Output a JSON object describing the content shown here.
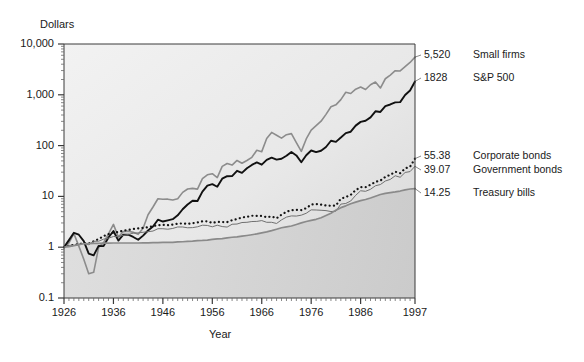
{
  "figure": {
    "y_axis_title": "Dollars",
    "x_axis_title": "Year"
  },
  "chart_data": {
    "type": "line",
    "title": "",
    "subtitle": "",
    "xlabel": "Year",
    "ylabel": "Dollars",
    "yscale": "log",
    "ylim": [
      0.1,
      10000
    ],
    "xlim": [
      1926,
      1997
    ],
    "grid": false,
    "legend_position": "right-of-plot-endpoints",
    "ytick_labels": [
      "10,000",
      "1,000",
      "100",
      "10",
      "1",
      "0.1"
    ],
    "ytick_values": [
      10000,
      1000,
      100,
      10,
      1,
      0.1
    ],
    "xtick_labels": [
      "1926",
      "1936",
      "1946",
      "1956",
      "1966",
      "1976",
      "1986",
      "1997"
    ],
    "xtick_values": [
      1926,
      1936,
      1946,
      1956,
      1966,
      1976,
      1986,
      1997
    ],
    "end_values": {
      "small_firms": "5,520",
      "sp500": "1828",
      "corporate_bonds": "55.38",
      "government_bonds": "39.07",
      "treasury_bills": "14.25"
    },
    "series": [
      {
        "name": "Small firms",
        "label": "Small firms",
        "end_value_label": "5,520",
        "end_value": 5520,
        "color": "#8c8c8c",
        "style": "solid",
        "width": 1.6,
        "x": [
          1926,
          1927,
          1928,
          1929,
          1930,
          1931,
          1932,
          1933,
          1934,
          1935,
          1936,
          1937,
          1938,
          1939,
          1940,
          1941,
          1942,
          1943,
          1944,
          1945,
          1946,
          1947,
          1948,
          1949,
          1950,
          1951,
          1952,
          1953,
          1954,
          1955,
          1956,
          1957,
          1958,
          1959,
          1960,
          1961,
          1962,
          1963,
          1964,
          1965,
          1966,
          1967,
          1968,
          1969,
          1970,
          1971,
          1972,
          1973,
          1974,
          1975,
          1976,
          1977,
          1978,
          1979,
          1980,
          1981,
          1982,
          1983,
          1984,
          1985,
          1986,
          1987,
          1988,
          1989,
          1990,
          1991,
          1992,
          1993,
          1994,
          1995,
          1996,
          1997
        ],
        "y": [
          1.0,
          1.22,
          1.85,
          1.05,
          0.58,
          0.3,
          0.32,
          0.99,
          1.23,
          1.82,
          2.81,
          1.58,
          2.03,
          2.07,
          1.96,
          1.79,
          2.37,
          4.35,
          6.19,
          9.0,
          8.76,
          8.82,
          8.48,
          8.98,
          12.0,
          14.0,
          14.4,
          13.9,
          22.3,
          26.6,
          28.0,
          23.5,
          38.9,
          44.4,
          41.4,
          51.0,
          45.0,
          51.0,
          58.8,
          81.0,
          76.0,
          138.0,
          182.0,
          160.0,
          140.0,
          164.0,
          172.0,
          114.0,
          77.0,
          135.0,
          202.0,
          247.0,
          302.0,
          412.0,
          581.0,
          634.0,
          803.0,
          1120.0,
          1060.0,
          1290.0,
          1420.0,
          1270.0,
          1580.0,
          1780.0,
          1360.0,
          2070.0,
          2450.0,
          2980.0,
          2950.0,
          3580.0,
          4330.0,
          5520.0
        ]
      },
      {
        "name": "S&P 500",
        "label": "S&P 500",
        "end_value_label": "1828",
        "end_value": 1828,
        "color": "#111111",
        "style": "solid",
        "width": 1.9,
        "x": [
          1926,
          1927,
          1928,
          1929,
          1930,
          1931,
          1932,
          1933,
          1934,
          1935,
          1936,
          1937,
          1938,
          1939,
          1940,
          1941,
          1942,
          1943,
          1944,
          1945,
          1946,
          1947,
          1948,
          1949,
          1950,
          1951,
          1952,
          1953,
          1954,
          1955,
          1956,
          1957,
          1958,
          1959,
          1960,
          1961,
          1962,
          1963,
          1964,
          1965,
          1966,
          1967,
          1968,
          1969,
          1970,
          1971,
          1972,
          1973,
          1974,
          1975,
          1976,
          1977,
          1978,
          1979,
          1980,
          1981,
          1982,
          1983,
          1984,
          1985,
          1986,
          1987,
          1988,
          1989,
          1990,
          1991,
          1992,
          1993,
          1994,
          1995,
          1996,
          1997
        ],
        "y": [
          1.0,
          1.38,
          1.92,
          1.76,
          1.32,
          0.75,
          0.69,
          1.06,
          1.05,
          1.55,
          2.08,
          1.35,
          1.77,
          1.76,
          1.59,
          1.4,
          1.69,
          2.13,
          2.55,
          3.48,
          3.2,
          3.38,
          3.56,
          4.24,
          5.58,
          6.92,
          8.19,
          8.11,
          12.4,
          16.3,
          17.4,
          15.5,
          22.3,
          25.0,
          25.1,
          31.9,
          29.1,
          35.7,
          41.6,
          46.8,
          42.1,
          52.2,
          58.0,
          53.1,
          55.2,
          63.1,
          75.1,
          64.1,
          47.1,
          64.7,
          80.1,
          74.4,
          79.3,
          94.0,
          124.5,
          118.4,
          143.9,
          176.4,
          187.6,
          247.2,
          293.2,
          308.6,
          359.8,
          473.7,
          459.0,
          598.9,
          644.5,
          709.3,
          718.7,
          988.8,
          1215.0,
          1828.0
        ]
      },
      {
        "name": "Corporate bonds",
        "label": "Corporate bonds",
        "end_value_label": "55.38",
        "end_value": 55.38,
        "color": "#141414",
        "style": "dotted",
        "width": 2.2,
        "x": [
          1926,
          1927,
          1928,
          1929,
          1930,
          1931,
          1932,
          1933,
          1934,
          1935,
          1936,
          1937,
          1938,
          1939,
          1940,
          1941,
          1942,
          1943,
          1944,
          1945,
          1946,
          1947,
          1948,
          1949,
          1950,
          1951,
          1952,
          1953,
          1954,
          1955,
          1956,
          1957,
          1958,
          1959,
          1960,
          1961,
          1962,
          1963,
          1964,
          1965,
          1966,
          1967,
          1968,
          1969,
          1970,
          1971,
          1972,
          1973,
          1974,
          1975,
          1976,
          1977,
          1978,
          1979,
          1980,
          1981,
          1982,
          1983,
          1984,
          1985,
          1986,
          1987,
          1988,
          1989,
          1990,
          1991,
          1992,
          1993,
          1994,
          1995,
          1996,
          1997
        ],
        "y": [
          1.0,
          1.07,
          1.11,
          1.15,
          1.2,
          1.18,
          1.31,
          1.45,
          1.65,
          1.81,
          1.94,
          2.0,
          2.12,
          2.2,
          2.28,
          2.35,
          2.41,
          2.48,
          2.6,
          2.71,
          2.75,
          2.71,
          2.8,
          2.89,
          2.95,
          2.87,
          2.97,
          3.07,
          3.23,
          3.23,
          3.01,
          3.15,
          3.13,
          3.12,
          3.4,
          3.57,
          3.85,
          3.96,
          4.16,
          4.13,
          4.13,
          3.9,
          4.03,
          3.71,
          4.38,
          5.0,
          5.34,
          5.43,
          5.38,
          5.87,
          6.91,
          7.04,
          6.91,
          6.64,
          6.52,
          6.61,
          9.0,
          9.72,
          10.7,
          13.3,
          15.2,
          15.2,
          17.0,
          19.4,
          20.5,
          24.2,
          26.6,
          30.6,
          28.6,
          35.5,
          38.4,
          55.38
        ]
      },
      {
        "name": "Government bonds",
        "label": "Government bonds",
        "end_value_label": "39.07",
        "end_value": 39.07,
        "color": "#707070",
        "style": "solid",
        "width": 1.0,
        "x": [
          1926,
          1927,
          1928,
          1929,
          1930,
          1931,
          1932,
          1933,
          1934,
          1935,
          1936,
          1937,
          1938,
          1939,
          1940,
          1941,
          1942,
          1943,
          1944,
          1945,
          1946,
          1947,
          1948,
          1949,
          1950,
          1951,
          1952,
          1953,
          1954,
          1955,
          1956,
          1957,
          1958,
          1959,
          1960,
          1961,
          1962,
          1963,
          1964,
          1965,
          1966,
          1967,
          1968,
          1969,
          1970,
          1971,
          1972,
          1973,
          1974,
          1975,
          1976,
          1977,
          1978,
          1979,
          1980,
          1981,
          1982,
          1983,
          1984,
          1985,
          1986,
          1987,
          1988,
          1989,
          1990,
          1991,
          1992,
          1993,
          1994,
          1995,
          1996,
          1997
        ],
        "y": [
          1.0,
          1.09,
          1.09,
          1.13,
          1.18,
          1.12,
          1.31,
          1.31,
          1.44,
          1.51,
          1.62,
          1.62,
          1.71,
          1.78,
          1.89,
          1.91,
          1.97,
          2.02,
          2.08,
          2.31,
          2.31,
          2.26,
          2.34,
          2.5,
          2.5,
          2.41,
          2.43,
          2.52,
          2.71,
          2.68,
          2.52,
          2.71,
          2.55,
          2.49,
          2.83,
          2.86,
          3.06,
          3.09,
          3.2,
          3.22,
          3.34,
          3.09,
          3.09,
          2.93,
          3.45,
          3.91,
          4.13,
          4.1,
          4.27,
          4.66,
          5.43,
          5.4,
          5.33,
          5.25,
          5.03,
          5.12,
          7.05,
          7.26,
          8.12,
          10.5,
          12.9,
          12.6,
          13.8,
          16.2,
          17.1,
          20.1,
          21.6,
          25.5,
          23.8,
          29.6,
          30.8,
          39.07
        ]
      },
      {
        "name": "Treasury bills",
        "label": "Treasury bills",
        "end_value_label": "14.25",
        "end_value": 14.25,
        "color": "#8a8a8a",
        "style": "solid",
        "width": 1.7,
        "x": [
          1926,
          1927,
          1928,
          1929,
          1930,
          1931,
          1932,
          1933,
          1934,
          1935,
          1936,
          1937,
          1938,
          1939,
          1940,
          1941,
          1942,
          1943,
          1944,
          1945,
          1946,
          1947,
          1948,
          1949,
          1950,
          1951,
          1952,
          1953,
          1954,
          1955,
          1956,
          1957,
          1958,
          1959,
          1960,
          1961,
          1962,
          1963,
          1964,
          1965,
          1966,
          1967,
          1968,
          1969,
          1970,
          1971,
          1972,
          1973,
          1974,
          1975,
          1976,
          1977,
          1978,
          1979,
          1980,
          1981,
          1982,
          1983,
          1984,
          1985,
          1986,
          1987,
          1988,
          1989,
          1990,
          1991,
          1992,
          1993,
          1994,
          1995,
          1996,
          1997
        ],
        "y": [
          1.0,
          1.03,
          1.07,
          1.12,
          1.17,
          1.18,
          1.19,
          1.19,
          1.2,
          1.2,
          1.21,
          1.21,
          1.21,
          1.21,
          1.21,
          1.21,
          1.22,
          1.22,
          1.23,
          1.23,
          1.24,
          1.24,
          1.25,
          1.27,
          1.28,
          1.3,
          1.32,
          1.35,
          1.36,
          1.38,
          1.42,
          1.46,
          1.48,
          1.53,
          1.57,
          1.6,
          1.65,
          1.7,
          1.76,
          1.83,
          1.92,
          2.01,
          2.12,
          2.26,
          2.41,
          2.52,
          2.61,
          2.8,
          3.02,
          3.21,
          3.37,
          3.54,
          3.8,
          4.2,
          4.67,
          5.37,
          6.0,
          6.52,
          7.16,
          7.72,
          8.24,
          8.7,
          9.31,
          10.1,
          10.9,
          11.5,
          11.9,
          12.25,
          12.75,
          13.45,
          14.0,
          14.25
        ]
      }
    ]
  },
  "plot": {
    "left": 64,
    "top": 44,
    "right": 415,
    "bottom": 298
  }
}
